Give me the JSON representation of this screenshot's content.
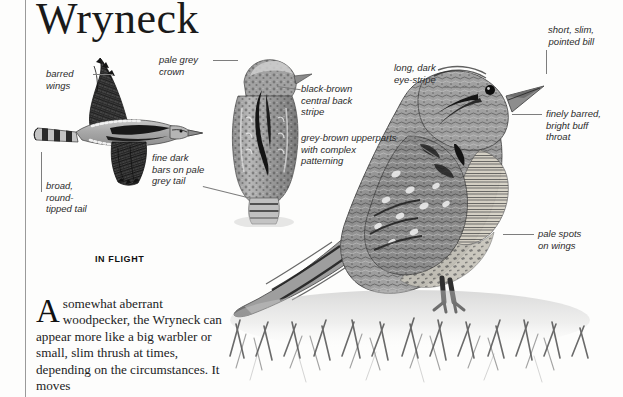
{
  "page": {
    "background_color": "#fdfdfc",
    "margin_rule_color": "#9a9a9a"
  },
  "title": {
    "species_name": "Wryneck"
  },
  "captions": {
    "in_flight": "IN FLIGHT"
  },
  "annotations": [
    {
      "id": "barred-wings",
      "text": "barred\nwings"
    },
    {
      "id": "broad-round-tail",
      "text": "broad,\nround-\ntipped tail"
    },
    {
      "id": "pale-grey-crown",
      "text": "pale grey\ncrown"
    },
    {
      "id": "fine-dark-bars-tail",
      "text": "fine dark\nbars on pale\ngrey tail"
    },
    {
      "id": "black-brown-stripe",
      "text": "black-brown\ncentral back\nstripe"
    },
    {
      "id": "grey-brown-upperparts",
      "text": "grey-brown upperparts\nwith complex\npatterning"
    },
    {
      "id": "long-dark-eye-stripe",
      "text": "long, dark\neye-stripe"
    },
    {
      "id": "short-slim-bill",
      "text": "short, slim,\npointed bill"
    },
    {
      "id": "finely-barred-throat",
      "text": "finely barred,\nbright buff\nthroat"
    },
    {
      "id": "pale-spots-wings",
      "text": "pale spots\non wings"
    }
  ],
  "body": {
    "dropcap": "A",
    "paragraph": "somewhat aberrant woodpecker, the Wryneck can appear more like a big warbler or small, slim thrush at times, depending on the circumstances. It moves"
  },
  "illustrations": {
    "flying_bird": "wryneck-in-flight",
    "rear_bird": "wryneck-rear-view",
    "perched_bird": "wryneck-perched",
    "habitat": "grass-ground-cover"
  }
}
